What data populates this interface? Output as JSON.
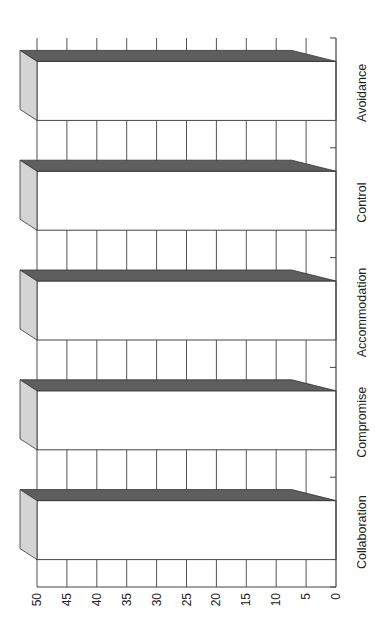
{
  "chart_data": {
    "type": "bar",
    "orientation": "rotated-90-ccw",
    "style": "3d",
    "title": "",
    "xlabel": "",
    "ylabel": "",
    "categories": [
      "Collaboration",
      "Compromise",
      "Accommodation",
      "Control",
      "Avoidance"
    ],
    "values": [
      50,
      50,
      50,
      50,
      50
    ],
    "ylim": [
      0,
      50
    ],
    "yticks": [
      0,
      5,
      10,
      15,
      20,
      25,
      30,
      35,
      40,
      45,
      50
    ],
    "grid": true,
    "legend": null
  },
  "colors": {
    "bar_front": "#ffffff",
    "bar_top": "#5e5e5e",
    "bar_side": "#d4d4d4",
    "grid": "#555555",
    "axis": "#444444",
    "text": "#222222"
  }
}
